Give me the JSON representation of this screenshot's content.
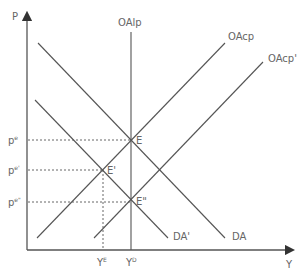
{
  "diagram": {
    "axes": {
      "y_label": "P",
      "x_label": "Y"
    },
    "curves": {
      "oalp": "OAlp",
      "oacp": "OAcp",
      "oacp_prime": "OAcp'",
      "da": "DA",
      "da_prime": "DA'"
    },
    "points": {
      "e": "E",
      "e_prime": "E'",
      "e_double_prime": "E\""
    },
    "price_levels": [
      {
        "base": "p",
        "sup": "e"
      },
      {
        "base": "p",
        "sup": "e'"
      },
      {
        "base": "p",
        "sup": "e\""
      }
    ],
    "output_levels": [
      {
        "base": "Y",
        "sup": "E"
      },
      {
        "base": "Y",
        "sup": "D"
      }
    ],
    "colors": {
      "line": "#555555",
      "text": "#666666"
    }
  }
}
